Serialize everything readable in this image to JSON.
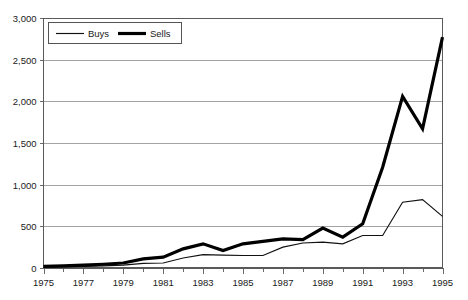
{
  "chart_data": {
    "type": "line",
    "title": "",
    "subtitle": "",
    "xlabel": "",
    "ylabel": "",
    "xlim": [
      1975,
      1995
    ],
    "ylim": [
      0,
      3000
    ],
    "grid": "horizontal",
    "legend_position": "top-left-inside",
    "x": [
      1975,
      1976,
      1977,
      1978,
      1979,
      1980,
      1981,
      1982,
      1983,
      1984,
      1985,
      1986,
      1987,
      1988,
      1989,
      1990,
      1991,
      1992,
      1993,
      1994,
      1995
    ],
    "xtick_labels": [
      "1975",
      "1977",
      "1979",
      "1981",
      "1983",
      "1985",
      "1987",
      "1989",
      "1991",
      "1993",
      "1995"
    ],
    "xtick_values": [
      1975,
      1977,
      1979,
      1981,
      1983,
      1985,
      1987,
      1989,
      1991,
      1993,
      1995
    ],
    "ytick_labels": [
      "0",
      "500",
      "1,000",
      "1,500",
      "2,000",
      "2,500",
      "3,000"
    ],
    "ytick_values": [
      0,
      500,
      1000,
      1500,
      2000,
      2500,
      3000
    ],
    "series": [
      {
        "name": "Buys",
        "style": "thin-line",
        "color": "#111111",
        "values": [
          10,
          15,
          20,
          25,
          35,
          55,
          60,
          120,
          160,
          155,
          150,
          150,
          250,
          300,
          310,
          290,
          390,
          390,
          790,
          820,
          620
        ]
      },
      {
        "name": "Sells",
        "style": "thick-line",
        "color": "#000000",
        "values": [
          20,
          25,
          35,
          45,
          60,
          110,
          130,
          230,
          290,
          210,
          290,
          320,
          350,
          340,
          480,
          370,
          530,
          1210,
          2060,
          1670,
          2770
        ]
      }
    ]
  },
  "legend": {
    "entries": [
      {
        "label": "Buys"
      },
      {
        "label": "Sells"
      }
    ]
  },
  "colors": {
    "buys": "#111111",
    "sells": "#000000",
    "gridline": "#8c8c8c",
    "axis": "#5a5a5a",
    "background": "#ffffff"
  }
}
